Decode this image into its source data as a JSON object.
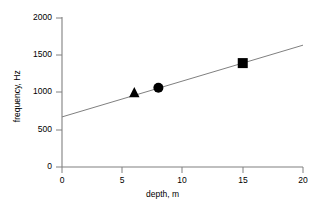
{
  "chart_data": {
    "type": "scatter",
    "title": "",
    "xlabel": "depth, m",
    "ylabel": "frequency, Hz",
    "xlim": [
      0,
      20
    ],
    "ylim": [
      0,
      2000
    ],
    "xticks": [
      0,
      5,
      10,
      15,
      20
    ],
    "yticks": [
      0,
      500,
      1000,
      1500,
      2000
    ],
    "xtick_labels": [
      "0",
      "5",
      "10",
      "15",
      "20"
    ],
    "ytick_labels": [
      "0",
      "500",
      "1000",
      "1500",
      "2000"
    ],
    "grid": false,
    "legend": false,
    "legend_position": "none",
    "marker_color": "#000000",
    "line_color": "#808080",
    "axis_color": "#808080",
    "text_color": "#000000",
    "background": "#ffffff",
    "series": [
      {
        "name": "measurements",
        "type": "scatter",
        "marker_color": "#000000",
        "points": [
          {
            "marker": "triangle",
            "x": 6,
            "y": 1000
          },
          {
            "marker": "circle",
            "x": 8,
            "y": 1060
          },
          {
            "marker": "square",
            "x": 15,
            "y": 1390
          }
        ]
      },
      {
        "name": "trend line",
        "type": "line",
        "line_color": "#808080",
        "x": [
          0,
          20
        ],
        "values": [
          670,
          1630
        ]
      }
    ]
  }
}
